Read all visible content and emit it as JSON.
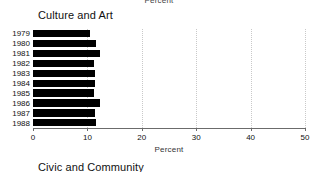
{
  "figure": {
    "top_clipped_axis_label": "Percent",
    "next_panel_title": "Civic and Community"
  },
  "chart_data": {
    "type": "bar",
    "orientation": "horizontal",
    "title": "Culture and Art",
    "xlabel": "Percent",
    "ylabel": "",
    "categories": [
      "1979",
      "1980",
      "1981",
      "1982",
      "1983",
      "1984",
      "1985",
      "1986",
      "1987",
      "1988"
    ],
    "values": [
      10.4,
      11.5,
      12.3,
      11.3,
      11.4,
      11.4,
      11.3,
      12.4,
      11.4,
      11.5
    ],
    "xlim": [
      0,
      50
    ],
    "xticks": [
      0,
      10,
      20,
      30,
      40,
      50
    ],
    "xticklabels": [
      "0",
      "10",
      "20",
      "30",
      "40",
      "50"
    ],
    "grid": true,
    "grid_axis": "x",
    "grid_style": "dotted",
    "bar_color": "#000000",
    "grid_color": "#c9c9c9",
    "axis_color": "#6b6b6b",
    "legend": null
  }
}
